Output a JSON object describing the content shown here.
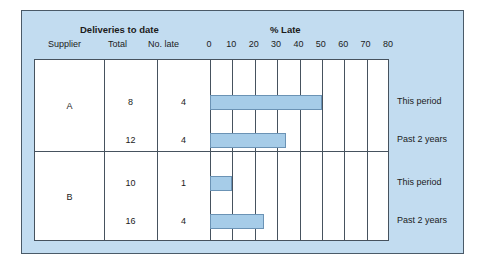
{
  "panel": {
    "bg_color": "#c2dcf0",
    "border_color": "#4a5a68"
  },
  "header": {
    "group_title_left": "Deliveries to date",
    "group_title_right": "% Late",
    "columns": [
      "Supplier",
      "Total",
      "No. late"
    ]
  },
  "chart_data": {
    "type": "bar",
    "orientation": "horizontal",
    "title": "% Late",
    "xlabel": "% Late",
    "ylabel": "",
    "xlim": [
      0,
      80
    ],
    "xticks": [
      0,
      10,
      20,
      30,
      40,
      50,
      60,
      70,
      80
    ],
    "grid": true,
    "legend": "none",
    "bar_color": "#a6cce8",
    "bar_edge_color": "#6b93b5",
    "categories": [
      "A - This period",
      "A - Past 2 years",
      "B - This period",
      "B - Past 2 years"
    ],
    "values": [
      50,
      34,
      10,
      24
    ],
    "table": {
      "columns": [
        "Supplier",
        "Total",
        "No. late",
        "% Late"
      ],
      "rows": [
        {
          "supplier": "A",
          "period": "This period",
          "total": "8",
          "no_late": "4",
          "pct_late": 50
        },
        {
          "supplier": "A",
          "period": "Past 2 years",
          "total": "12",
          "no_late": "4",
          "pct_late": 34
        },
        {
          "supplier": "B",
          "period": "This period",
          "total": "10",
          "no_late": "1",
          "pct_late": 10
        },
        {
          "supplier": "B",
          "period": "Past 2 years",
          "total": "16",
          "no_late": "4",
          "pct_late": 24
        }
      ]
    },
    "groups": [
      {
        "supplier": "A",
        "series_labels": [
          "This period",
          "Past 2 years"
        ]
      },
      {
        "supplier": "B",
        "series_labels": [
          "This period",
          "Past 2 years"
        ]
      }
    ]
  }
}
